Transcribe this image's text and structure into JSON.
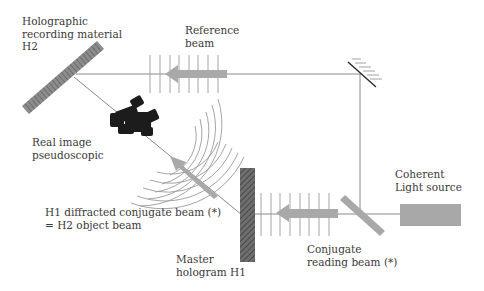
{
  "diagram": {
    "title": "",
    "labels": {
      "h2_line1": "Holographic",
      "h2_line2": "recording material",
      "h2_line3": "H2",
      "reference_line1": "Reference",
      "reference_line2": "beam",
      "real_image_line1": "Real image",
      "real_image_line2": "pseudoscopic",
      "coherent_line1": "Coherent",
      "coherent_line2": "Light source",
      "diffracted_line1": "H1 diffracted conjugate beam (*)",
      "diffracted_line2": "= H2 object beam",
      "master_line1": "Master",
      "master_line2": "hologram H1",
      "conjugate_line1": "Conjugate",
      "conjugate_line2": "reading beam (*)"
    },
    "components": [
      {
        "name": "Holographic recording material H2",
        "type": "plate"
      },
      {
        "name": "Mirror",
        "type": "mirror"
      },
      {
        "name": "Real image pseudoscopic",
        "type": "object"
      },
      {
        "name": "Master hologram H1",
        "type": "plate"
      },
      {
        "name": "Beam splitter",
        "type": "splitter"
      },
      {
        "name": "Coherent Light source",
        "type": "source"
      }
    ],
    "beams": [
      {
        "name": "Reference beam",
        "from": "Mirror",
        "to": "H2"
      },
      {
        "name": "Conjugate reading beam (*)",
        "from": "Beam splitter",
        "to": "H1"
      },
      {
        "name": "H1 diffracted conjugate beam (*) = H2 object beam",
        "from": "H1",
        "to": "H2"
      }
    ],
    "colors": {
      "line": "#8a8a8a",
      "arrow": "#a9a9a9",
      "plate": "#7a7a7a",
      "object": "#1a1a1a",
      "text": "#3a3a3a"
    }
  }
}
